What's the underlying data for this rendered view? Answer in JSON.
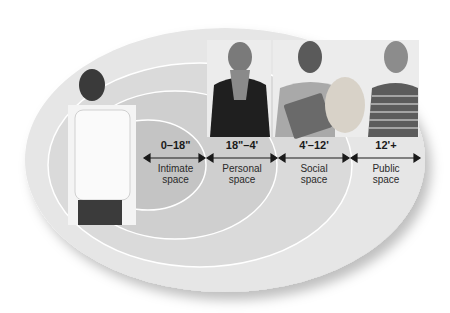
{
  "diagram": {
    "colors": {
      "outer_ring": "#e6e6e6",
      "social_ring": "#d9d9d9",
      "personal_ring": "#cfcfcf",
      "intimate_ring": "#c4c4c4",
      "ring_stroke": "#ffffff",
      "arrow": "#1a1a1a"
    },
    "zones": [
      {
        "distance": "0–18\"",
        "label_line1": "Intimate",
        "label_line2": "space"
      },
      {
        "distance": "18\"–4'",
        "label_line1": "Personal",
        "label_line2": "space"
      },
      {
        "distance": "4'–12'",
        "label_line1": "Social",
        "label_line2": "space"
      },
      {
        "distance": "12'+",
        "label_line1": "Public",
        "label_line2": "space"
      }
    ],
    "people": [
      {
        "description": "Man in white t-shirt standing at center"
      },
      {
        "description": "Woman in dark coat with scarf"
      },
      {
        "description": "Man holding folder/binders"
      },
      {
        "description": "Woman in striped sweater holding grocery bag"
      }
    ]
  }
}
